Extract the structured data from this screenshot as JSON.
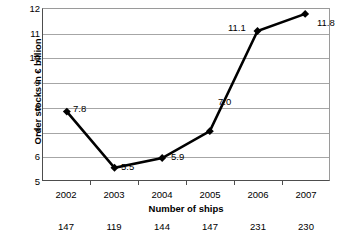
{
  "chart_data": {
    "type": "line",
    "title": "",
    "xlabel": "Number of ships",
    "ylabel": "Order stocks in € billion",
    "categories": [
      "2002",
      "2003",
      "2004",
      "2005",
      "2006",
      "2007"
    ],
    "values": [
      7.8,
      5.5,
      5.9,
      7.0,
      11.1,
      11.8
    ],
    "point_labels": [
      "7.8",
      "5.5",
      "5.9",
      "7.0",
      "11.1",
      "11.8"
    ],
    "secondary_axis": {
      "name": "Number of ships",
      "values": [
        147,
        119,
        144,
        147,
        231,
        230
      ],
      "labels": [
        "147",
        "119",
        "144",
        "147",
        "231",
        "230"
      ]
    },
    "ylim": [
      5,
      12
    ],
    "y_ticks": [
      "12",
      "11",
      "10",
      "9",
      "8",
      "7",
      "6",
      "5"
    ],
    "grid": true,
    "legend": "none",
    "colors": {
      "line": "#000000",
      "marker": "#000000",
      "gridline": "#a6a6a6",
      "axis": "#4d4d4d",
      "background": "#ffffff",
      "text": "#000000"
    }
  }
}
